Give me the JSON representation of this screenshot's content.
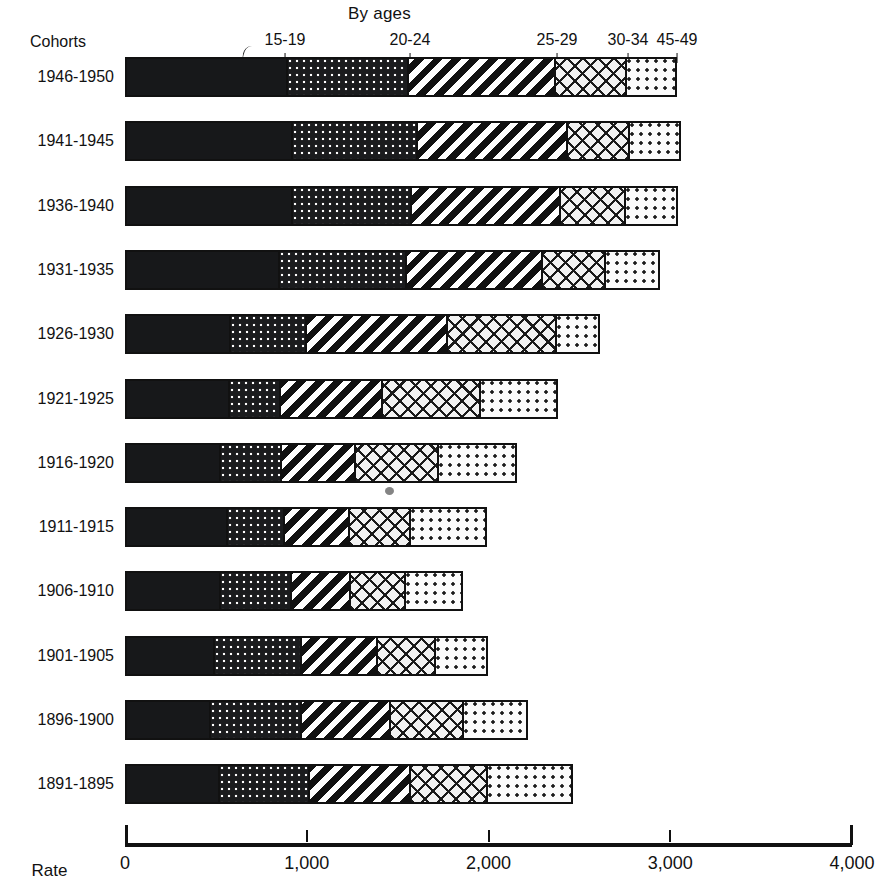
{
  "figure": {
    "top_title": "By ages",
    "cohorts_header": "Cohorts",
    "axis_title": "Rate"
  },
  "age_headers": [
    {
      "label": "15-19",
      "x": 285
    },
    {
      "label": "20-24",
      "x": 410
    },
    {
      "label": "25-29",
      "x": 557
    },
    {
      "label": "30-34",
      "x": 628
    },
    {
      "label": "45-49",
      "x": 677
    }
  ],
  "axis": {
    "ticks": [
      {
        "label": "0",
        "value": 0
      },
      {
        "label": "1,000",
        "value": 1000
      },
      {
        "label": "2,000",
        "value": 2000
      },
      {
        "label": "3,000",
        "value": 3000
      },
      {
        "label": "4,000",
        "value": 4000
      }
    ]
  },
  "chart_data": {
    "type": "bar",
    "orientation": "horizontal",
    "stacked": true,
    "title": "By ages",
    "xlabel": "Rate",
    "ylabel": "Cohorts",
    "xlim": [
      0,
      4000
    ],
    "grid": false,
    "legend": "above-bars",
    "categories": [
      "1946-1950",
      "1941-1945",
      "1936-1940",
      "1931-1935",
      "1926-1930",
      "1921-1925",
      "1916-1920",
      "1911-1915",
      "1906-1910",
      "1901-1905",
      "1896-1900",
      "1891-1895"
    ],
    "series": [
      {
        "name": "15-19",
        "fill": "solid",
        "values": [
          880,
          908,
          908,
          836,
          567,
          561,
          512,
          550,
          512,
          479,
          457,
          506
        ]
      },
      {
        "name": "20-24",
        "fill": "dots-dark",
        "values": [
          672,
          693,
          660,
          704,
          418,
          281,
          341,
          319,
          396,
          484,
          506,
          501
        ]
      },
      {
        "name": "25-29",
        "fill": "diagonal",
        "values": [
          814,
          831,
          825,
          754,
          787,
          567,
          407,
          358,
          330,
          424,
          495,
          561
        ]
      },
      {
        "name": "30-34",
        "fill": "crosshatch",
        "values": [
          396,
          347,
          363,
          352,
          605,
          544,
          462,
          341,
          303,
          319,
          402,
          424
        ]
      },
      {
        "name": "45-49",
        "fill": "dots-light",
        "values": [
          275,
          280,
          286,
          297,
          236,
          429,
          435,
          424,
          319,
          291,
          358,
          473
        ]
      }
    ],
    "totals": [
      3037,
      3059,
      3042,
      2943,
      2613,
      2382,
      2157,
      1992,
      1860,
      1997,
      2218,
      2465
    ]
  },
  "bars": [
    {
      "label": "1946-1950",
      "boundaries": [
        880,
        1552,
        2366,
        2762,
        3037
      ]
    },
    {
      "label": "1941-1945",
      "boundaries": [
        908,
        1601,
        2432,
        2779,
        3059
      ]
    },
    {
      "label": "1936-1940",
      "boundaries": [
        908,
        1568,
        2393,
        2756,
        3042
      ]
    },
    {
      "label": "1931-1935",
      "boundaries": [
        836,
        1540,
        2294,
        2646,
        2943
      ]
    },
    {
      "label": "1926-1930",
      "boundaries": [
        567,
        985,
        1772,
        2377,
        2613
      ]
    },
    {
      "label": "1921-1925",
      "boundaries": [
        561,
        842,
        1409,
        1953,
        2382
      ]
    },
    {
      "label": "1916-1920",
      "boundaries": [
        512,
        853,
        1260,
        1722,
        2157
      ]
    },
    {
      "label": "1911-1915",
      "boundaries": [
        550,
        869,
        1227,
        1568,
        1992
      ]
    },
    {
      "label": "1906-1910",
      "boundaries": [
        512,
        908,
        1238,
        1541,
        1860
      ]
    },
    {
      "label": "1901-1905",
      "boundaries": [
        479,
        963,
        1387,
        1706,
        1997
      ]
    },
    {
      "label": "1896-1900",
      "boundaries": [
        457,
        963,
        1458,
        1860,
        2218
      ]
    },
    {
      "label": "1891-1895",
      "boundaries": [
        506,
        1007,
        1568,
        1992,
        2465
      ]
    }
  ]
}
